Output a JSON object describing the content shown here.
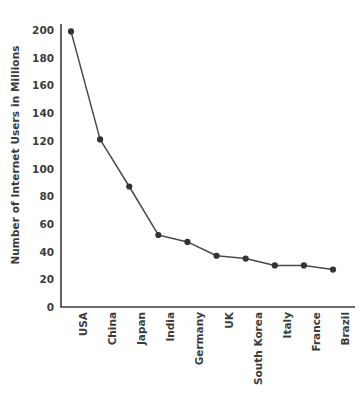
{
  "chart_data": {
    "type": "line",
    "title": "",
    "xlabel": "",
    "ylabel": "Number of Internet Users in Millions",
    "categories": [
      "USA",
      "China",
      "Japan",
      "India",
      "Germany",
      "UK",
      "South Korea",
      "Italy",
      "France",
      "Brazil"
    ],
    "values": [
      199,
      121,
      87,
      52,
      47,
      37,
      35,
      30,
      30,
      27
    ],
    "series": [
      {
        "name": "Number of Internet Users in Millions",
        "values": [
          199,
          121,
          87,
          52,
          47,
          37,
          35,
          30,
          30,
          27
        ]
      }
    ],
    "ylim": [
      0,
      200
    ],
    "yticks": [
      0,
      20,
      40,
      60,
      80,
      100,
      120,
      140,
      160,
      180,
      200
    ],
    "ytick_labels": [
      "0",
      "20",
      "40",
      "60",
      "80",
      "100",
      "120",
      "140",
      "160",
      "180",
      "200"
    ],
    "grid": false,
    "legend": false,
    "legend_position": "none",
    "marker": "circle",
    "line_color": "#4a4a4a",
    "marker_color": "#333333",
    "axis_color": "#3c3c3c",
    "background_color": "#ffffff",
    "xtick_rotation": -90
  }
}
